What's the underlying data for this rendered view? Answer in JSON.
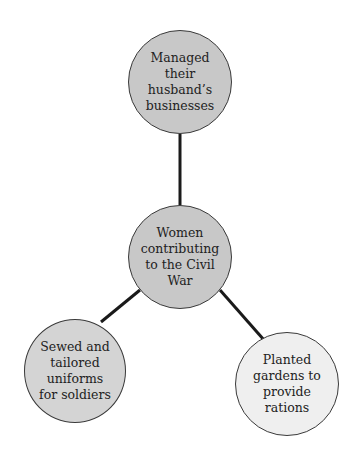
{
  "diagram": {
    "type": "concept-web",
    "center": {
      "label": "Women\ncontributing\nto the Civil\nWar",
      "fill": "#c8c8c8"
    },
    "nodes": [
      {
        "id": "top",
        "label": "Managed\ntheir\nhusband’s\nbusinesses",
        "fill": "#c8c8c8"
      },
      {
        "id": "bottom-left",
        "label": "Sewed and\ntailored\nuniforms\nfor soldiers",
        "fill": "#d4d4d4"
      },
      {
        "id": "bottom-right",
        "label": "Planted\ngardens to\nprovide\nrations",
        "fill": "#efefef"
      }
    ],
    "connector_color": "#1a1a1a"
  }
}
